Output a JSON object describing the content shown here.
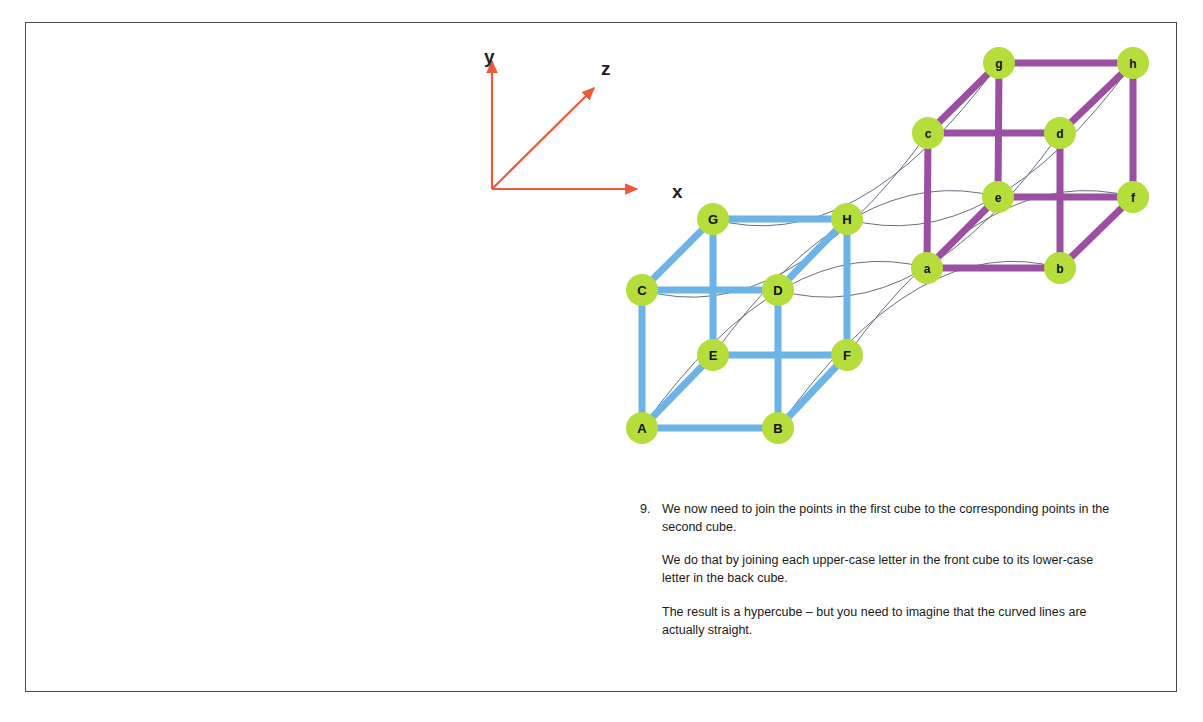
{
  "page": {
    "background_color": "#ffffff",
    "frame_color": "#4a4a4a"
  },
  "axes": {
    "color": "#f0573c",
    "origin": {
      "x": 492,
      "y": 189
    },
    "labels": [
      {
        "name": "y",
        "text": "y",
        "x": 484,
        "y": 47
      },
      {
        "name": "z",
        "text": "z",
        "x": 601,
        "y": 59
      },
      {
        "name": "x",
        "text": "x",
        "x": 672,
        "y": 182
      }
    ],
    "arrows": [
      {
        "name": "y-axis-arrow",
        "x1": 492,
        "y1": 189,
        "x2": 492,
        "y2": 61
      },
      {
        "name": "z-axis-arrow",
        "x1": 492,
        "y1": 189,
        "x2": 594,
        "y2": 88
      },
      {
        "name": "x-axis-arrow",
        "x1": 492,
        "y1": 189,
        "x2": 637,
        "y2": 189
      }
    ]
  },
  "chart_data": {
    "type": "diagram",
    "front_cube": {
      "name": "front-cube",
      "edge_color": "#6cb4e8",
      "label_case": "upper",
      "nodes": [
        {
          "id": "A",
          "label": "A",
          "x": 642,
          "y": 428
        },
        {
          "id": "B",
          "label": "B",
          "x": 778,
          "y": 428
        },
        {
          "id": "C",
          "label": "C",
          "x": 642,
          "y": 290
        },
        {
          "id": "D",
          "label": "D",
          "x": 778,
          "y": 290
        },
        {
          "id": "E",
          "label": "E",
          "x": 713,
          "y": 355
        },
        {
          "id": "F",
          "label": "F",
          "x": 847,
          "y": 355
        },
        {
          "id": "G",
          "label": "G",
          "x": 713,
          "y": 219
        },
        {
          "id": "H",
          "label": "H",
          "x": 847,
          "y": 219
        }
      ],
      "edges": [
        [
          "A",
          "B"
        ],
        [
          "A",
          "C"
        ],
        [
          "A",
          "E"
        ],
        [
          "B",
          "D"
        ],
        [
          "B",
          "F"
        ],
        [
          "C",
          "D"
        ],
        [
          "C",
          "G"
        ],
        [
          "D",
          "H"
        ],
        [
          "E",
          "F"
        ],
        [
          "E",
          "G"
        ],
        [
          "F",
          "H"
        ],
        [
          "G",
          "H"
        ]
      ]
    },
    "back_cube": {
      "name": "back-cube",
      "edge_color": "#9b4fa0",
      "label_case": "lower",
      "nodes": [
        {
          "id": "a",
          "label": "a",
          "x": 927,
          "y": 268
        },
        {
          "id": "b",
          "label": "b",
          "x": 1060,
          "y": 268
        },
        {
          "id": "c",
          "label": "c",
          "x": 928,
          "y": 133
        },
        {
          "id": "d",
          "label": "d",
          "x": 1060,
          "y": 133
        },
        {
          "id": "e",
          "label": "e",
          "x": 998,
          "y": 197
        },
        {
          "id": "f",
          "label": "f",
          "x": 1133,
          "y": 197
        },
        {
          "id": "g",
          "label": "g",
          "x": 999,
          "y": 63
        },
        {
          "id": "h",
          "label": "h",
          "x": 1133,
          "y": 63
        }
      ],
      "edges": [
        [
          "a",
          "b"
        ],
        [
          "a",
          "c"
        ],
        [
          "a",
          "e"
        ],
        [
          "b",
          "d"
        ],
        [
          "b",
          "f"
        ],
        [
          "c",
          "d"
        ],
        [
          "c",
          "g"
        ],
        [
          "d",
          "h"
        ],
        [
          "e",
          "f"
        ],
        [
          "e",
          "g"
        ],
        [
          "f",
          "h"
        ],
        [
          "g",
          "h"
        ]
      ]
    },
    "connectors": {
      "name": "hypercube-connectors",
      "color": "#555f6e",
      "pairs": [
        {
          "from": "A",
          "to": "a",
          "bow": -120
        },
        {
          "from": "B",
          "to": "b",
          "bow": -120
        },
        {
          "from": "C",
          "to": "c",
          "bow": 120
        },
        {
          "from": "D",
          "to": "d",
          "bow": 120
        },
        {
          "from": "E",
          "to": "e",
          "bow": -118
        },
        {
          "from": "F",
          "to": "f",
          "bow": -118
        },
        {
          "from": "G",
          "to": "g",
          "bow": 118
        },
        {
          "from": "H",
          "to": "h",
          "bow": 118
        }
      ]
    },
    "node_style": {
      "fill": "#b5dd3c",
      "radius": 16,
      "text_color": "#111111"
    }
  },
  "caption": {
    "number": "9.",
    "paragraphs": [
      "We now need to join the points in the first cube to the corresponding points in the second cube.",
      "We do that by joining each upper-case letter in the front cube to its lower-case letter in the back cube.",
      "The result is a hypercube – but you need to imagine that the curved lines are actually straight."
    ]
  }
}
